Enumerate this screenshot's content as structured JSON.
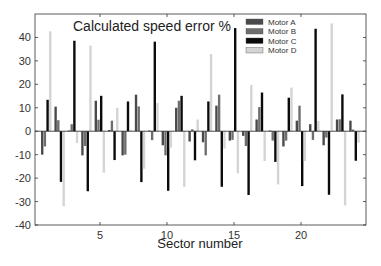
{
  "chart_data": {
    "type": "bar",
    "title": "Calculated speed error %",
    "xlabel": "Sector number",
    "ylabel": "",
    "xlim": [
      0.15,
      24.85
    ],
    "ylim": [
      -40,
      50
    ],
    "yticks": [
      -40,
      -30,
      -20,
      -10,
      0,
      10,
      20,
      30,
      40
    ],
    "xticks": [
      5,
      10,
      15,
      20
    ],
    "grid": false,
    "legend_position": "upper right",
    "categories": [
      1,
      2,
      3,
      4,
      5,
      6,
      7,
      8,
      9,
      10,
      11,
      12,
      13,
      14,
      15,
      16,
      17,
      18,
      19,
      20,
      21,
      22,
      23,
      24
    ],
    "series": [
      {
        "name": "Motor A",
        "color": "#4a4a4a",
        "values": [
          -10,
          10.5,
          0.3,
          -10.3,
          13,
          0.5,
          -10.3,
          15.6,
          0.3,
          -6,
          10,
          -4.4,
          -4.7,
          10.9,
          -4,
          -2,
          5,
          0.3,
          -6.5,
          4.5,
          3,
          -6,
          5,
          4.5
        ]
      },
      {
        "name": "Motor B",
        "color": "#6e6e6e",
        "values": [
          -6.5,
          4.7,
          3,
          -6.3,
          4.9,
          4.5,
          -10,
          10.6,
          -3.8,
          -10.3,
          13,
          0.8,
          -10.3,
          15.6,
          -3.7,
          -6.3,
          10.3,
          -4,
          -4,
          10.9,
          -3.7,
          -2.7,
          5.1,
          0.7
        ]
      },
      {
        "name": "Motor C",
        "color": "#0a0a0a",
        "values": [
          13.4,
          -21.6,
          38.6,
          -25.6,
          15.1,
          -12.3,
          12.7,
          -21.7,
          38.2,
          -25.4,
          15.1,
          -12.4,
          12.7,
          -23.7,
          44,
          -27.2,
          16.5,
          -13.1,
          14.3,
          -23.4,
          43.7,
          -27.1,
          15.7,
          -12.6
        ]
      },
      {
        "name": "Motor D",
        "color": "#d4d4d4",
        "values": [
          42.6,
          -32,
          -5,
          36.5,
          -17.7,
          10,
          0.5,
          -16,
          12,
          -7,
          -23.7,
          5,
          32.9,
          -7.4,
          -17.9,
          19.7,
          -12.7,
          -22.7,
          18.6,
          -12.7,
          4.4,
          46,
          -31.7,
          -4.9
        ]
      }
    ]
  }
}
